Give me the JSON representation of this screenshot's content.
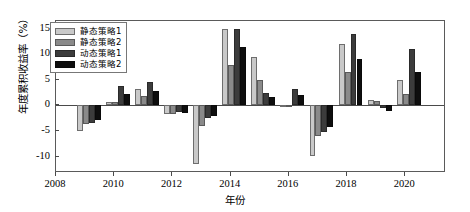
{
  "chart_data": {
    "type": "bar",
    "title": "",
    "xlabel": "年份",
    "ylabel": "年度累积收益率（%）",
    "categories": [
      2009,
      2010,
      2011,
      2012,
      2013,
      2014,
      2015,
      2016,
      2017,
      2018,
      2019,
      2020
    ],
    "xlim": [
      2008,
      2021.4
    ],
    "ylim": [
      -13.2,
      16.5
    ],
    "yticks": [
      15,
      10,
      5,
      0,
      -5,
      -10
    ],
    "xticks": [
      2008,
      2010,
      2012,
      2014,
      2016,
      2018,
      2020
    ],
    "grid": false,
    "legend_position": "upper-left",
    "series": [
      {
        "name": "静态策略1",
        "color": "#c9c9c9",
        "values": [
          -5.0,
          0.6,
          3.3,
          -1.6,
          -11.5,
          15.0,
          9.5,
          -0.3,
          -9.8,
          12.0,
          1.0,
          5.0
        ]
      },
      {
        "name": "静态策略2",
        "color": "#8a8a8a",
        "values": [
          -3.6,
          0.7,
          1.8,
          -1.7,
          -4.0,
          8.0,
          5.0,
          -0.2,
          -6.0,
          6.5,
          0.8,
          2.2
        ]
      },
      {
        "name": "动态策略1",
        "color": "#3c3c3c",
        "values": [
          -3.4,
          3.8,
          4.5,
          -1.2,
          -2.5,
          15.0,
          2.4,
          3.2,
          -5.2,
          14.0,
          -0.5,
          11.0
        ]
      },
      {
        "name": "动态策略2",
        "color": "#0e0e0e",
        "values": [
          -2.9,
          2.2,
          2.8,
          -1.5,
          -2.0,
          11.5,
          1.6,
          2.0,
          -4.3,
          9.0,
          -1.1,
          6.5
        ]
      }
    ]
  },
  "axes": {
    "y_title": "年度累积收益率（%）",
    "x_title": "年份",
    "y_tick_labels": [
      "15",
      "10",
      "5",
      "0",
      "-5",
      "-10"
    ],
    "x_tick_labels": [
      "2008",
      "2010",
      "2012",
      "2014",
      "2016",
      "2018",
      "2020"
    ]
  },
  "legend": {
    "items": [
      {
        "label": "静态策略1"
      },
      {
        "label": "静态策略2"
      },
      {
        "label": "动态策略1"
      },
      {
        "label": "动态策略2"
      }
    ]
  }
}
